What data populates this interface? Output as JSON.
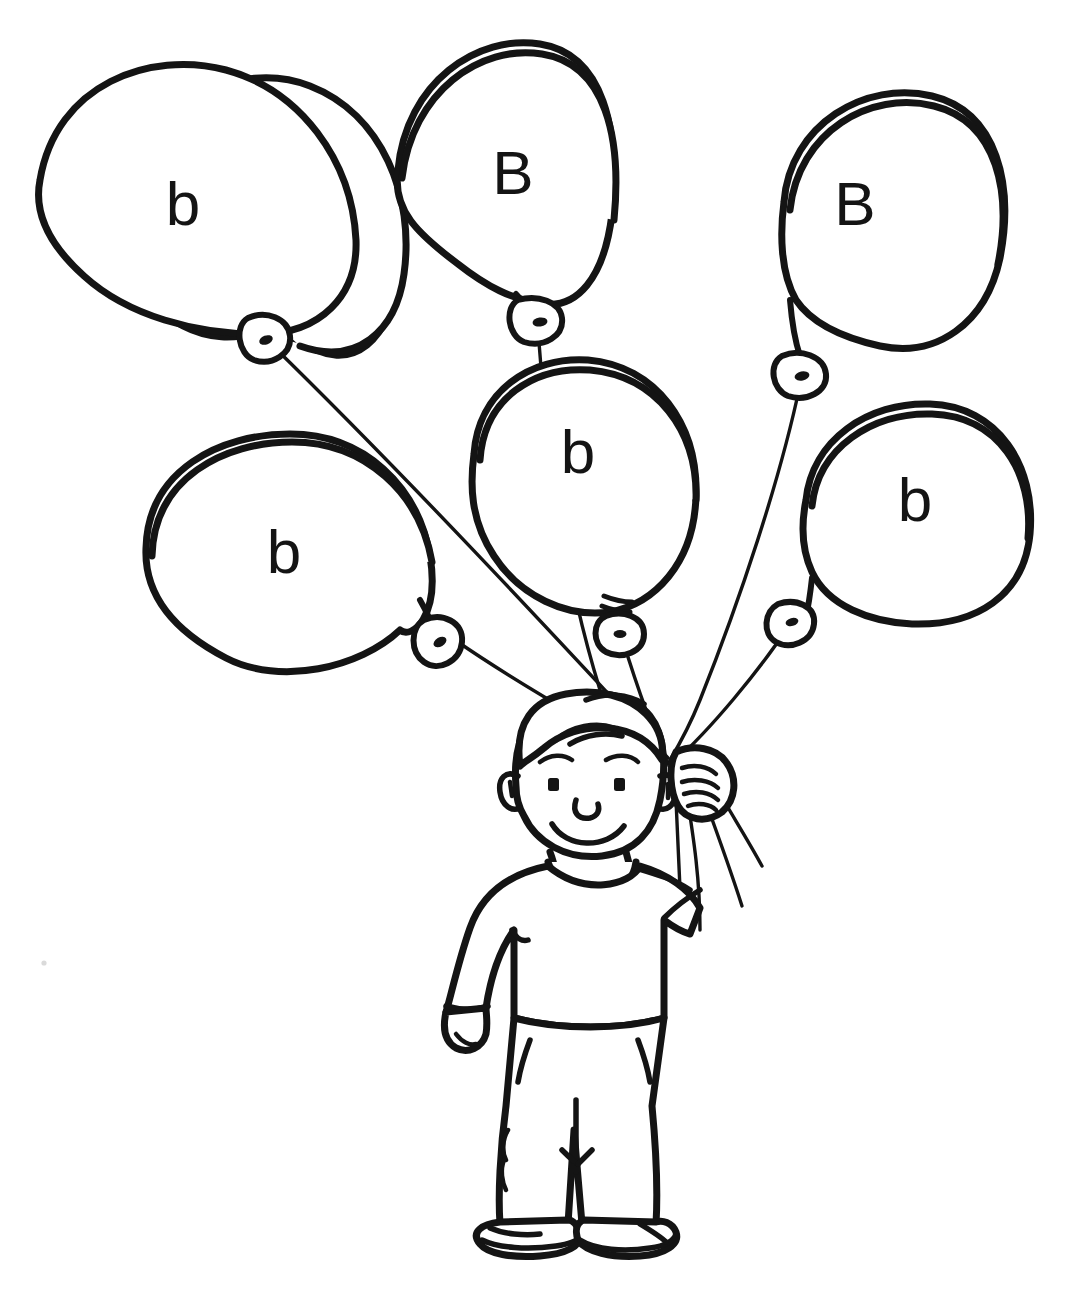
{
  "page": {
    "kind": "line-art-coloring-page",
    "background_color": "#ffffff",
    "ink_color": "#141414",
    "width": 1076,
    "height": 1297
  },
  "balloons": [
    {
      "id": "balloon-top-left",
      "letter": "b",
      "letter_case": "lowercase",
      "label_x": 183,
      "label_y": 225,
      "knot_x": 262,
      "knot_y": 338
    },
    {
      "id": "balloon-top-middle",
      "letter": "B",
      "letter_case": "uppercase",
      "label_x": 513,
      "label_y": 194,
      "knot_x": 540,
      "knot_y": 313
    },
    {
      "id": "balloon-top-right",
      "letter": "B",
      "letter_case": "uppercase",
      "label_x": 855,
      "label_y": 225,
      "knot_x": 803,
      "knot_y": 370
    },
    {
      "id": "balloon-middle-left",
      "letter": "b",
      "letter_case": "lowercase",
      "label_x": 284,
      "label_y": 573,
      "knot_x": 442,
      "knot_y": 637
    },
    {
      "id": "balloon-center",
      "letter": "b",
      "letter_case": "lowercase",
      "label_x": 578,
      "label_y": 473,
      "knot_x": 623,
      "knot_y": 622
    },
    {
      "id": "balloon-right",
      "letter": "b",
      "letter_case": "lowercase",
      "label_x": 915,
      "label_y": 521,
      "knot_x": 797,
      "knot_y": 617
    }
  ],
  "summary": {
    "balloon_count": 6,
    "lowercase_count": 4,
    "uppercase_count": 2,
    "letters_in_reading_order": [
      "b",
      "B",
      "B",
      "b",
      "b",
      "b"
    ]
  },
  "figure": {
    "id": "boy",
    "parts": [
      "hair",
      "face",
      "eyebrows",
      "eyes",
      "nose",
      "smile",
      "ears",
      "neck-collar",
      "sweater",
      "left-hand",
      "raised-arm",
      "gripping-hand",
      "pants",
      "pockets",
      "shoes"
    ]
  }
}
